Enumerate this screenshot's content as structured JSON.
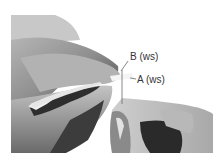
{
  "image": {
    "description": "Grayscale photograph of two hands pinching fabric strips/threads between fingers",
    "background": "#ffffff",
    "tones": {
      "light": "#d8d8d8",
      "mid": "#9a9a9a",
      "dark": "#3a3a3a",
      "shadow": "#1e1e1e"
    }
  },
  "labels": [
    {
      "id": "B",
      "text": "B (ws)"
    },
    {
      "id": "A",
      "text": "A (ws)"
    }
  ]
}
